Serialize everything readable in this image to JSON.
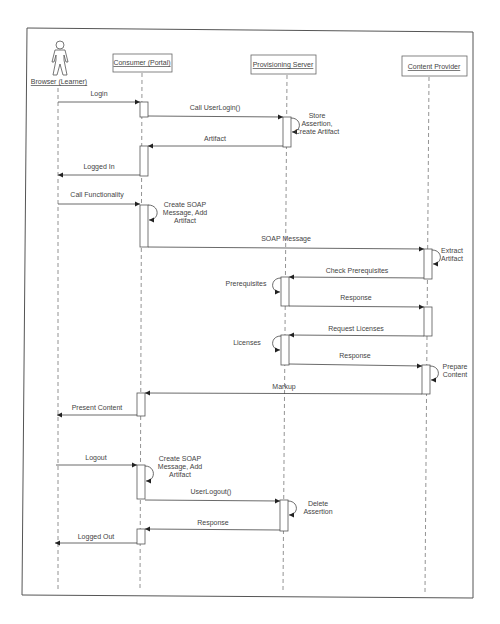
{
  "diagram": {
    "type": "uml-sequence-diagram",
    "participants": [
      {
        "id": "browser",
        "label": "Browser (Learner)",
        "kind": "actor"
      },
      {
        "id": "consumer",
        "label": "Consumer (Portal)",
        "kind": "object"
      },
      {
        "id": "provisioning",
        "label": "Provisioning Server",
        "kind": "object"
      },
      {
        "id": "content",
        "label": "Content Provider",
        "kind": "object"
      }
    ],
    "messages": [
      {
        "from": "browser",
        "to": "consumer",
        "label": "Login"
      },
      {
        "from": "consumer",
        "to": "provisioning",
        "label": "Call UserLogin()"
      },
      {
        "from": "provisioning",
        "to": "provisioning",
        "label_lines": [
          "Store",
          "Assertion,",
          "Create Artifact"
        ]
      },
      {
        "from": "provisioning",
        "to": "consumer",
        "label": "Artifact"
      },
      {
        "from": "consumer",
        "to": "browser",
        "label": "Logged In"
      },
      {
        "from": "browser",
        "to": "consumer",
        "label": "Call Functionality"
      },
      {
        "from": "consumer",
        "to": "consumer",
        "label_lines": [
          "Create SOAP",
          "Message, Add",
          "Artifact"
        ]
      },
      {
        "from": "consumer",
        "to": "content",
        "label": "SOAP Message"
      },
      {
        "from": "content",
        "to": "content",
        "label_lines": [
          "Extract",
          "Artifact"
        ]
      },
      {
        "from": "content",
        "to": "provisioning",
        "label": "Check Prerequisites"
      },
      {
        "from": "provisioning",
        "to": "provisioning",
        "label_lines": [
          "Prerequisites"
        ]
      },
      {
        "from": "provisioning",
        "to": "content",
        "label": "Response"
      },
      {
        "from": "content",
        "to": "provisioning",
        "label": "Request Licenses"
      },
      {
        "from": "provisioning",
        "to": "provisioning",
        "label_lines": [
          "Licenses"
        ]
      },
      {
        "from": "provisioning",
        "to": "content",
        "label": "Response"
      },
      {
        "from": "content",
        "to": "content",
        "label_lines": [
          "Prepare",
          "Content"
        ]
      },
      {
        "from": "content",
        "to": "consumer",
        "label": "Markup"
      },
      {
        "from": "consumer",
        "to": "browser",
        "label": "Present Content"
      },
      {
        "from": "browser",
        "to": "consumer",
        "label": "Logout"
      },
      {
        "from": "consumer",
        "to": "consumer",
        "label_lines": [
          "Create SOAP",
          "Message, Add",
          "Artifact"
        ]
      },
      {
        "from": "consumer",
        "to": "provisioning",
        "label": "UserLogout()"
      },
      {
        "from": "provisioning",
        "to": "provisioning",
        "label_lines": [
          "Delete",
          "Assertion"
        ]
      },
      {
        "from": "provisioning",
        "to": "consumer",
        "label": "Response"
      },
      {
        "from": "consumer",
        "to": "browser",
        "label": "Logged Out"
      }
    ]
  },
  "labels": {
    "p_browser": "Browser (Learner)",
    "p_consumer": "Consumer (Portal)",
    "p_provisioning": "Provisioning Server",
    "p_content": "Content Provider",
    "m_login": "Login",
    "m_call_userlogin": "Call UserLogin()",
    "s_store_1": "Store",
    "s_store_2": "Assertion,",
    "s_store_3": "Create Artifact",
    "m_artifact": "Artifact",
    "m_logged_in": "Logged In",
    "m_call_func": "Call Functionality",
    "s_create1_1": "Create SOAP",
    "s_create1_2": "Message, Add",
    "s_create1_3": "Artifact",
    "m_soap": "SOAP Message",
    "s_extract_1": "Extract",
    "s_extract_2": "Artifact",
    "m_check_prereq": "Check Prerequisites",
    "s_prereq": "Prerequisites",
    "m_response1": "Response",
    "m_request_lic": "Request Licenses",
    "s_licenses": "Licenses",
    "m_response2": "Response",
    "s_prepare_1": "Prepare",
    "s_prepare_2": "Content",
    "m_markup": "Markup",
    "m_present": "Present Content",
    "m_logout": "Logout",
    "s_create2_1": "Create SOAP",
    "s_create2_2": "Message, Add",
    "s_create2_3": "Artifact",
    "m_userlogout": "UserLogout()",
    "s_delete_1": "Delete",
    "s_delete_2": "Assertion",
    "m_response3": "Response",
    "m_logged_out": "Logged Out"
  }
}
